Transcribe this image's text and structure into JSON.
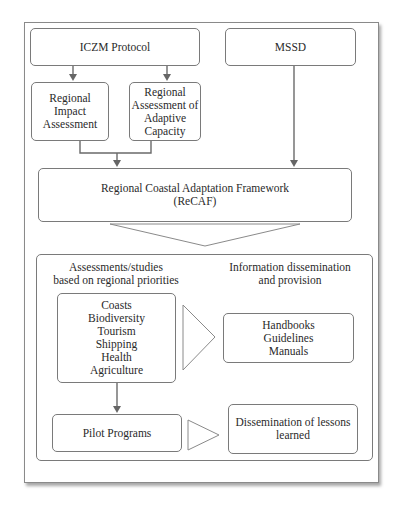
{
  "diagram": {
    "top_boxes": {
      "iczm": "ICZM Protocol",
      "mssd": "MSSD"
    },
    "sub_boxes": {
      "impact": [
        "Regional",
        "Impact",
        "Assessment"
      ],
      "adaptive": [
        "Regional",
        "Assessment of",
        "Adaptive",
        "Capacity"
      ]
    },
    "framework": {
      "line1": "Regional Coastal Adaptation Framework",
      "line2": "(ReCAF)"
    },
    "lower_section": {
      "left_heading": [
        "Assessments/studies",
        "based on regional priorities"
      ],
      "right_heading": [
        "Information dissemination",
        "and provision"
      ],
      "topics": [
        "Coasts",
        "Biodiversity",
        "Tourism",
        "Shipping",
        "Health",
        "Agriculture"
      ],
      "outputs": [
        "Handbooks",
        "Guidelines",
        "Manuals"
      ],
      "pilot": "Pilot Programs",
      "lessons": [
        "Dissemination of lessons",
        "learned"
      ]
    },
    "colors": {
      "stroke": "#7a7a7a",
      "arrow": "#666666",
      "text": "#2a2a2a"
    }
  }
}
